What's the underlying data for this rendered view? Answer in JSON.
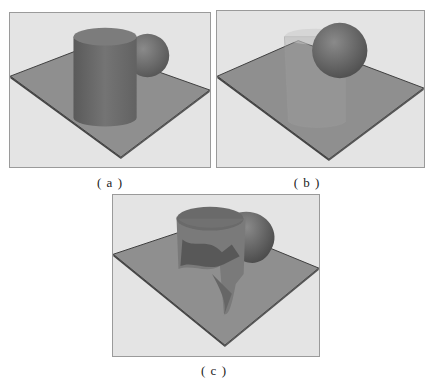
{
  "figure": {
    "panels": [
      {
        "id": "a",
        "label": "( a )",
        "description": "Opaque cylinder in front of a sphere on a ground plane"
      },
      {
        "id": "b",
        "label": "( b )",
        "description": "Translucent cylinder with sphere on a ground plane"
      },
      {
        "id": "c",
        "label": "( c )",
        "description": "Cylinder cut by sphere (boolean result) on a ground plane"
      }
    ],
    "colors": {
      "background": "#e4e4e4",
      "plane": "#8d8d8d",
      "plane_edge": "#3e3e3e",
      "cylinder": "#6f6f6f",
      "sphere": "#6a6a6a",
      "border": "#9a9a9a"
    }
  }
}
